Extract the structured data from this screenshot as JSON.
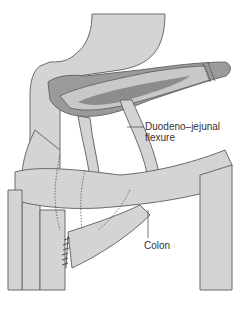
{
  "figure": {
    "type": "anatomical illustration",
    "labels": {
      "dj_flexure_line1": "Duodeno–jejunal",
      "dj_flexure_line2": "flexure",
      "colon": "Colon"
    },
    "colors": {
      "organ_fill": "#d4d4d4",
      "organ_dark": "#9a9a9a",
      "pancreas_core": "#8c8c8c",
      "outline": "#6a6a6a",
      "background": "#ffffff"
    }
  }
}
